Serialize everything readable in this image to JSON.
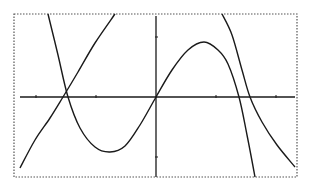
{
  "chart_data": {
    "type": "line",
    "title": "",
    "xlabel": "",
    "ylabel": "",
    "grid": false,
    "legend": null,
    "frame": "dotted",
    "axes": {
      "x_axis_y": 97,
      "y_axis_x": 156,
      "x_ticks_px": [
        36,
        96,
        216,
        276
      ],
      "y_ticks_px": [
        37,
        157
      ]
    },
    "series": [
      {
        "name": "curve-cubic",
        "points_px": [
          [
            48,
            14
          ],
          [
            58,
            55
          ],
          [
            68,
            97
          ],
          [
            80,
            128
          ],
          [
            95,
            147
          ],
          [
            110,
            152
          ],
          [
            125,
            146
          ],
          [
            140,
            125
          ],
          [
            156,
            97
          ],
          [
            172,
            70
          ],
          [
            188,
            50
          ],
          [
            204,
            42
          ],
          [
            218,
            50
          ],
          [
            228,
            64
          ],
          [
            239,
            97
          ],
          [
            247,
            135
          ],
          [
            255,
            177
          ]
        ]
      },
      {
        "name": "curve-oscillating",
        "points_px": [
          [
            20,
            168
          ],
          [
            35,
            140
          ],
          [
            50,
            118
          ],
          [
            63,
            97
          ],
          [
            78,
            72
          ],
          [
            95,
            43
          ],
          [
            115,
            14
          ]
        ],
        "points_px_2": [
          [
            222,
            14
          ],
          [
            232,
            35
          ],
          [
            242,
            70
          ],
          [
            250,
            97
          ],
          [
            262,
            122
          ],
          [
            277,
            145
          ],
          [
            295,
            167
          ]
        ]
      }
    ],
    "colors": {
      "curve": "#1a1a1a",
      "axis": "#1a1a1a",
      "frame": "#555555"
    }
  }
}
